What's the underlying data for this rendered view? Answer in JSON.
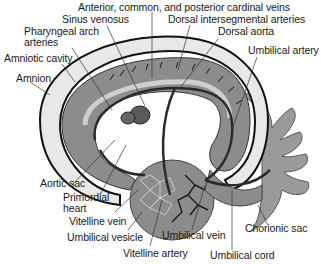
{
  "figure": {
    "labels": {
      "cardinal_veins": "Anterior, common, and posterior cardinal veins",
      "sinus_venosus": "Sinus venosus",
      "dorsal_intersegmental": "Dorsal intersegmental arteries",
      "pharyngeal_1": "Pharyngeal arch",
      "pharyngeal_2": "arteries",
      "dorsal_aorta": "Dorsal aorta",
      "amniotic_cavity": "Amniotic cavity",
      "umbilical_artery": "Umbilical artery",
      "amnion": "Amnion",
      "aortic_sac": "Aortic sac",
      "primordial_1": "Primordial",
      "primordial_2": "heart",
      "vitelline_vein": "Vitelline vein",
      "umbilical_vesicle": "Umbilical vesicle",
      "vitelline_artery": "Vitelline artery",
      "umbilical_vein": "Umbilical vein",
      "umbilical_cord": "Umbilical cord",
      "chorionic_sac": "Chorionic sac"
    },
    "colors": {
      "tissue": "#8c8c8c",
      "light_tissue": "#d4d4d4",
      "vessel": "#2a2a2a",
      "outline": "#111111"
    }
  }
}
